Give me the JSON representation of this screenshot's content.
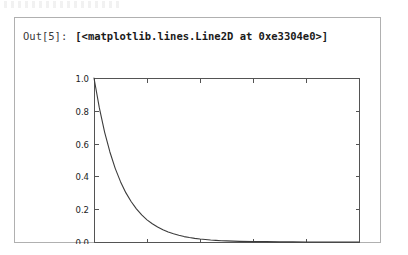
{
  "cell": {
    "prompt_label": "Out[5]:",
    "repr_text": "[<matplotlib.lines.Line2D at 0xe3304e0>]",
    "border_color": "#b0b0b0",
    "background": "#ffffff"
  },
  "chart_data": {
    "type": "line",
    "title": "",
    "xlabel": "",
    "ylabel": "",
    "xlim": [
      0,
      10
    ],
    "ylim": [
      0.0,
      1.0
    ],
    "xticks": [
      0,
      2,
      4,
      6,
      8,
      10
    ],
    "yticks": [
      0.0,
      0.2,
      0.4,
      0.6,
      0.8,
      1.0
    ],
    "xtick_labels": [
      "0",
      "2",
      "4",
      "6",
      "8",
      "10"
    ],
    "ytick_labels": [
      "0.0",
      "0.2",
      "0.4",
      "0.6",
      "0.8",
      "1.0"
    ],
    "grid": false,
    "legend": null,
    "line_color": "#3c3c3c",
    "axes_color": "#545454",
    "series": [
      {
        "name": "exp(-x)",
        "x": [
          0.0,
          0.2,
          0.4,
          0.6,
          0.8,
          1.0,
          1.2,
          1.4,
          1.6,
          1.8,
          2.0,
          2.2,
          2.4,
          2.6,
          2.8,
          3.0,
          3.2,
          3.4,
          3.6,
          3.8,
          4.0,
          4.2,
          4.4,
          4.6,
          4.8,
          5.0,
          5.5,
          6.0,
          6.5,
          7.0,
          7.5,
          8.0,
          8.5,
          9.0,
          9.5,
          10.0
        ],
        "y": [
          1.0,
          0.819,
          0.67,
          0.549,
          0.449,
          0.368,
          0.301,
          0.247,
          0.202,
          0.165,
          0.135,
          0.111,
          0.091,
          0.074,
          0.061,
          0.05,
          0.041,
          0.033,
          0.027,
          0.022,
          0.018,
          0.015,
          0.012,
          0.01,
          0.008,
          0.007,
          0.004,
          0.002,
          0.002,
          0.001,
          0.001,
          0.0,
          0.0,
          0.0,
          0.0,
          0.0
        ]
      }
    ]
  }
}
